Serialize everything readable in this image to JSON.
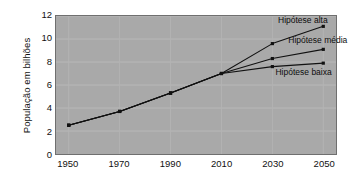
{
  "chart_data": {
    "type": "line",
    "title": "",
    "xlabel": "",
    "ylabel": "População em bilhões",
    "x": [
      1950,
      1970,
      1990,
      2010,
      2030,
      2050
    ],
    "categories": [
      "1950",
      "1970",
      "1990",
      "2010",
      "2030",
      "2050"
    ],
    "xlim": [
      1945,
      2055
    ],
    "ylim": [
      0,
      12
    ],
    "y_ticks": [
      0,
      2,
      4,
      6,
      8,
      10,
      12
    ],
    "y_tick_labels": [
      "0",
      "2",
      "4",
      "6",
      "8",
      "10",
      "12"
    ],
    "x_ticks": [
      1950,
      1970,
      1990,
      2010,
      2030,
      2050
    ],
    "x_tick_labels": [
      "1950",
      "1970",
      "1990",
      "2010",
      "2030",
      "2050"
    ],
    "grid": true,
    "legend_position": "inline-annotations",
    "marker": "square",
    "line_color": "#111111",
    "plot_background": "#a9a9a9",
    "page_background": "#ffffff",
    "series": [
      {
        "name": "Hipótese alta",
        "x": [
          1950,
          1970,
          1990,
          2010,
          2030,
          2050
        ],
        "values": [
          2.5,
          3.7,
          5.3,
          7.0,
          9.6,
          11.1
        ]
      },
      {
        "name": "Hipótese média",
        "x": [
          1950,
          1970,
          1990,
          2010,
          2030,
          2050
        ],
        "values": [
          2.5,
          3.7,
          5.3,
          7.0,
          8.3,
          9.1
        ]
      },
      {
        "name": "Hipótese baixa",
        "x": [
          1950,
          1970,
          1990,
          2010,
          2030,
          2050
        ],
        "values": [
          2.5,
          3.7,
          5.3,
          7.0,
          7.6,
          7.9
        ]
      }
    ],
    "annotations": [
      {
        "text": "Hipótese alta",
        "x": 2032,
        "y": 11.45
      },
      {
        "text": "Hipótese média",
        "x": 2036,
        "y": 9.75
      },
      {
        "text": "Hipótese baixa",
        "x": 2031,
        "y": 7.05
      }
    ]
  }
}
